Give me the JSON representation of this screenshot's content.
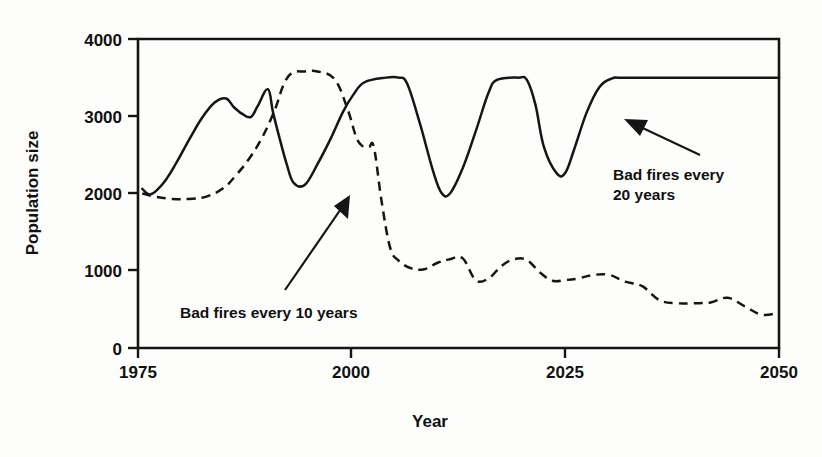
{
  "chart_data": {
    "type": "line",
    "title": "",
    "xlabel": "Year",
    "ylabel": "Population size",
    "xlim": [
      1975,
      2050
    ],
    "ylim": [
      0,
      4000
    ],
    "xticks": [
      1975,
      2000,
      2025,
      2050
    ],
    "xtick_labels": [
      "1975",
      "2000",
      "2025",
      "2050"
    ],
    "yticks": [
      0,
      1000,
      2000,
      3000,
      4000
    ],
    "ytick_labels": [
      "0",
      "1000",
      "2000",
      "3000",
      "4000"
    ],
    "grid": false,
    "legend_position": "inline-annotations",
    "annotations": [
      {
        "name": "bad-fires-20-years",
        "text_line1": "Bad fires every",
        "text_line2": "20 years",
        "points_to_series": "Bad fires every 20 years"
      },
      {
        "name": "bad-fires-10-years",
        "text_line1": "Bad fires every 10 years",
        "text_line2": "",
        "points_to_series": "Bad fires every 10 years"
      }
    ],
    "series": [
      {
        "name": "Bad fires every 20 years",
        "style": "solid",
        "x": [
          1975.5,
          1976.5,
          1978.0,
          1979.5,
          1981.0,
          1982.5,
          1984.0,
          1985.3,
          1986.2,
          1987.2,
          1988.2,
          1989.0,
          1990.2,
          1990.8,
          1991.6,
          1992.4,
          1993.2,
          1994.5,
          1996.0,
          1997.5,
          1999.0,
          2000.2,
          2001.5,
          2004.0,
          2005.5,
          2006.5,
          2008.0,
          2009.5,
          2010.5,
          2011.5,
          2013.0,
          2014.5,
          2016.0,
          2017.0,
          2019.5,
          2020.5,
          2021.5,
          2022.5,
          2024.0,
          2025.0,
          2026.0,
          2027.5,
          2029.0,
          2030.5,
          2032.0,
          2040.0,
          2050.0
        ],
        "y": [
          2060,
          1990,
          2140,
          2400,
          2700,
          2980,
          3180,
          3230,
          3120,
          3030,
          2990,
          3130,
          3350,
          3050,
          2700,
          2380,
          2140,
          2110,
          2380,
          2700,
          3060,
          3280,
          3440,
          3500,
          3500,
          3420,
          2900,
          2300,
          2010,
          2000,
          2330,
          2800,
          3300,
          3470,
          3500,
          3470,
          3150,
          2600,
          2260,
          2270,
          2560,
          3050,
          3380,
          3490,
          3500,
          3500,
          3500
        ]
      },
      {
        "name": "Bad fires every 10 years",
        "style": "dashed",
        "x": [
          1975.5,
          1977.0,
          1979.0,
          1981.0,
          1983.0,
          1985.0,
          1986.5,
          1988.0,
          1989.5,
          1991.0,
          1992.0,
          1993.0,
          1994.5,
          1996.0,
          1998.0,
          1999.5,
          2000.5,
          2001.2,
          2002.0,
          2002.6,
          2003.5,
          2004.5,
          2005.5,
          2007.0,
          2008.5,
          2010.0,
          2011.5,
          2013.0,
          2014.5,
          2016.0,
          2017.5,
          2019.0,
          2020.5,
          2022.0,
          2023.5,
          2025.0,
          2026.5,
          2028.0,
          2030.0,
          2032.0,
          2034.0,
          2036.0,
          2038.0,
          2040.0,
          2042.0,
          2044.0,
          2046.0,
          2048.0,
          2050.0
        ],
        "y": [
          2000,
          1960,
          1930,
          1930,
          1960,
          2070,
          2240,
          2450,
          2720,
          3080,
          3400,
          3560,
          3580,
          3580,
          3480,
          3100,
          2740,
          2620,
          2600,
          2600,
          1900,
          1300,
          1130,
          1030,
          1020,
          1100,
          1150,
          1160,
          880,
          900,
          1060,
          1150,
          1140,
          980,
          870,
          880,
          900,
          940,
          950,
          860,
          800,
          620,
          580,
          580,
          590,
          650,
          540,
          430,
          460
        ]
      }
    ]
  },
  "plot_geometry": {
    "left_px": 138,
    "right_px": 779,
    "top_px": 39,
    "bottom_px": 348
  },
  "labels": {
    "y_axis_title": "Population size",
    "x_axis_title": "Year"
  }
}
